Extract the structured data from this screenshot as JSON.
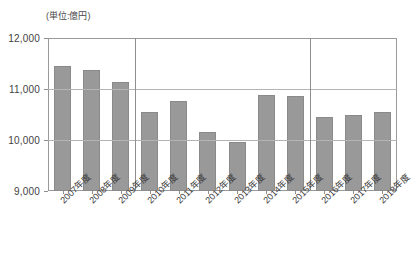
{
  "chart_data": {
    "type": "bar",
    "title": "(単位:億円)",
    "xlabel": "",
    "ylabel": "",
    "ylim": [
      9000,
      12000
    ],
    "ytick_values": [
      12000,
      11000,
      10000,
      9000
    ],
    "ytick_labels": [
      "12,000",
      "11,000",
      "10,000",
      "9,000"
    ],
    "grid": true,
    "legend": "none",
    "categories": [
      "2007年度",
      "2008年度",
      "2009年度",
      "2010年度",
      "2011年度",
      "2012年度",
      "2013年度",
      "2014年度",
      "2015年度",
      "2016年度",
      "2017年度",
      "2018年度"
    ],
    "values": [
      11450,
      11370,
      11140,
      10550,
      10770,
      10160,
      9960,
      10880,
      10860,
      10450,
      10490,
      10550
    ],
    "bar_color": "#999999",
    "annotations": [
      {
        "type": "vertical-divider",
        "after_category": "2009年度"
      },
      {
        "type": "vertical-divider",
        "after_category": "2015年度"
      }
    ]
  }
}
